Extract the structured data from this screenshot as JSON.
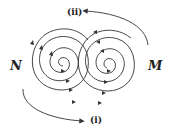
{
  "labels": {
    "left_pole": "N",
    "right_pole": "M",
    "top_arrow": "(ii)",
    "bottom_arrow": "(i)"
  },
  "colors": {
    "line": "#333333",
    "background": "#ffffff"
  }
}
